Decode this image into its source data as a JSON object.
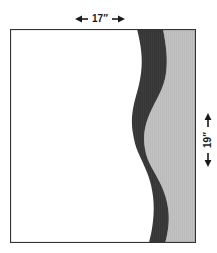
{
  "diagram": {
    "background_color": "#ffffff",
    "border_color": "#333333",
    "fill_color": "#ffffff",
    "dark_band_color": "#3a3a3a",
    "light_band_color": "#c0c0c0",
    "dimension_color": "#1a1a1a"
  },
  "dimensions": {
    "width": {
      "label": "17″",
      "value": 17,
      "unit": "inches",
      "orientation": "horizontal",
      "position": "top"
    },
    "height": {
      "label": "19″",
      "value": 19,
      "unit": "inches",
      "orientation": "vertical",
      "position": "right"
    }
  },
  "regions": {
    "white_region": "unshaded-left-area",
    "dark_region": "dark-wavy-band",
    "light_region": "light-gray-right-area"
  }
}
